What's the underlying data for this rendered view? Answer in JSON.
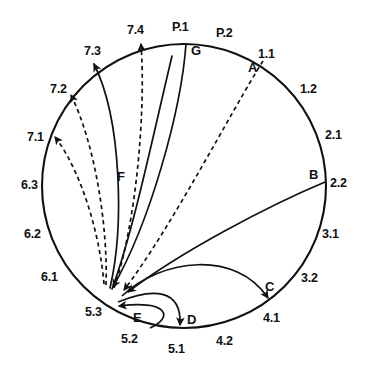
{
  "figure": {
    "type": "circular-flow-diagram",
    "shape": "circle",
    "background_color": "#ffffff",
    "stroke_color": "#111111",
    "circle": {
      "cx": 184,
      "cy": 186,
      "r": 142
    },
    "boundary_labels": [
      {
        "id": "P.1",
        "text": "P.1",
        "x": 172,
        "y": 21,
        "angle_deg": 92
      },
      {
        "id": "P.2",
        "text": "P.2",
        "x": 216,
        "y": 27,
        "angle_deg": 72
      },
      {
        "id": "1.1",
        "text": "1.1",
        "x": 258,
        "y": 48,
        "angle_deg": 53
      },
      {
        "id": "1.2",
        "text": "1.2",
        "x": 300,
        "y": 83,
        "angle_deg": 36
      },
      {
        "id": "2.1",
        "text": "2.1",
        "x": 325,
        "y": 129,
        "angle_deg": 20
      },
      {
        "id": "2.2",
        "text": "2.2",
        "x": 330,
        "y": 177,
        "angle_deg": 3
      },
      {
        "id": "3.1",
        "text": "3.1",
        "x": 322,
        "y": 228,
        "angle_deg": -16
      },
      {
        "id": "3.2",
        "text": "3.2",
        "x": 301,
        "y": 272,
        "angle_deg": -33
      },
      {
        "id": "4.1",
        "text": "4.1",
        "x": 263,
        "y": 312,
        "angle_deg": -52
      },
      {
        "id": "4.2",
        "text": "4.2",
        "x": 216,
        "y": 335,
        "angle_deg": -70
      },
      {
        "id": "5.1",
        "text": "5.1",
        "x": 168,
        "y": 343,
        "angle_deg": -91
      },
      {
        "id": "5.2",
        "text": "5.2",
        "x": 121,
        "y": 333,
        "angle_deg": -108
      },
      {
        "id": "5.3",
        "text": "5.3",
        "x": 85,
        "y": 306,
        "angle_deg": -128
      },
      {
        "id": "6.1",
        "text": "6.1",
        "x": 41,
        "y": 271,
        "angle_deg": -147
      },
      {
        "id": "6.2",
        "text": "6.2",
        "x": 24,
        "y": 228,
        "angle_deg": -164
      },
      {
        "id": "6.3",
        "text": "6.3",
        "x": 21,
        "y": 179,
        "angle_deg": 178
      },
      {
        "id": "7.1",
        "text": "7.1",
        "x": 27,
        "y": 131,
        "angle_deg": 159
      },
      {
        "id": "7.2",
        "text": "7.2",
        "x": 50,
        "y": 83,
        "angle_deg": 141
      },
      {
        "id": "7.3",
        "text": "7.3",
        "x": 84,
        "y": 45,
        "angle_deg": 124
      },
      {
        "id": "7.4",
        "text": "7.4",
        "x": 127,
        "y": 24,
        "angle_deg": 107
      }
    ],
    "connection_labels": [
      {
        "id": "A",
        "text": "A",
        "x": 248,
        "y": 61,
        "style": "dashed",
        "from": "1.1",
        "to": "5.3"
      },
      {
        "id": "B",
        "text": "B",
        "x": 309,
        "y": 168,
        "style": "solid",
        "from": "2.2",
        "to": "5.3"
      },
      {
        "id": "C",
        "text": "C",
        "x": 265,
        "y": 280,
        "style": "solid",
        "from": "5.3",
        "to": "4.1"
      },
      {
        "id": "D",
        "text": "D",
        "x": 187,
        "y": 313,
        "style": "solid",
        "from": "5.3",
        "to": "5.1"
      },
      {
        "id": "E",
        "text": "E",
        "x": 133,
        "y": 311,
        "style": "solid",
        "from": "5.2",
        "to": "5.3"
      },
      {
        "id": "F",
        "text": "F",
        "x": 117,
        "y": 170,
        "style": "solid",
        "from": "5.3",
        "to": "7.3"
      },
      {
        "id": "G",
        "text": "G",
        "x": 191,
        "y": 44,
        "style": "solid",
        "from": "P.1",
        "to": "5.3"
      }
    ],
    "connections": [
      {
        "id": "A",
        "style": "dashed",
        "direction": "inward",
        "source": "1.1",
        "target": "5.3"
      },
      {
        "id": "B",
        "style": "solid",
        "direction": "inward",
        "source": "2.2",
        "target": "5.3"
      },
      {
        "id": "C",
        "style": "solid",
        "direction": "outward",
        "source": "5.3",
        "target": "4.1"
      },
      {
        "id": "D",
        "style": "solid",
        "direction": "outward",
        "source": "5.3",
        "target": "5.1"
      },
      {
        "id": "E",
        "style": "solid",
        "direction": "inward",
        "source": "5.2",
        "target": "5.3"
      },
      {
        "id": "F",
        "style": "solid",
        "direction": "outward",
        "source": "5.3",
        "target": "7.3"
      },
      {
        "id": "G",
        "style": "solid",
        "direction": "inward",
        "source": "P.1",
        "target": "5.3"
      },
      {
        "id": "d1",
        "style": "dashed",
        "direction": "outward",
        "source": "5.3",
        "target": "7.1"
      },
      {
        "id": "d2",
        "style": "dashed",
        "direction": "outward",
        "source": "5.3",
        "target": "7.2"
      },
      {
        "id": "d3",
        "style": "dashed",
        "direction": "outward",
        "source": "5.3",
        "target": "7.4"
      }
    ],
    "hub_point": {
      "label": "5.3",
      "x": 108,
      "y": 292
    }
  }
}
